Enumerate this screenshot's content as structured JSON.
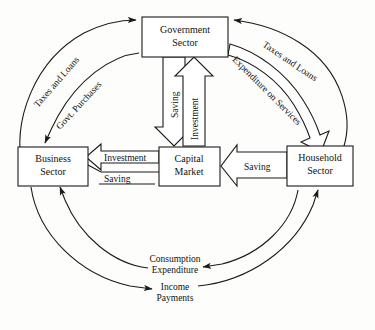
{
  "diagram": {
    "background_color": "#fdfdfc",
    "ink_color": "#1a1a1a",
    "nodes": [
      {
        "id": "government",
        "line1": "Government",
        "line2": "Sector",
        "x": 142,
        "y": 17,
        "w": 86,
        "h": 40
      },
      {
        "id": "business",
        "line1": "Business",
        "line2": "Sector",
        "x": 18,
        "y": 147,
        "w": 70,
        "h": 39
      },
      {
        "id": "capital",
        "line1": "Capital",
        "line2": "Market",
        "x": 159,
        "y": 147,
        "w": 61,
        "h": 39
      },
      {
        "id": "household",
        "line1": "Household",
        "line2": "Sector",
        "x": 287,
        "y": 146,
        "w": 66,
        "h": 40
      }
    ],
    "flows": [
      {
        "id": "taxes-loans-business",
        "label": "Taxes and Loans",
        "from": "business",
        "to": "government",
        "style": "thin-arc",
        "side": "left-outer"
      },
      {
        "id": "govt-purchases",
        "label": "Govt. Purchases",
        "from": "government",
        "to": "business",
        "style": "thin-arc",
        "side": "left-inner"
      },
      {
        "id": "taxes-loans-household",
        "label": "Taxes and Loans",
        "from": "household",
        "to": "government",
        "style": "thin-arc",
        "side": "right-outer"
      },
      {
        "id": "expenditure-on-services",
        "label": "Expenditure on Services",
        "from": "government",
        "to": "household",
        "style": "block-arrow",
        "side": "right-inner"
      },
      {
        "id": "saving-govt-capital",
        "label": "Saving",
        "from": "government",
        "to": "capital",
        "style": "block-arrow",
        "side": "center-down"
      },
      {
        "id": "investment-capital-govt",
        "label": "Investment",
        "from": "capital",
        "to": "government",
        "style": "block-arrow",
        "side": "center-up"
      },
      {
        "id": "investment-capital-business",
        "label": "Investment",
        "from": "capital",
        "to": "business",
        "style": "block-arrow",
        "side": "mid-left"
      },
      {
        "id": "saving-business-capital",
        "label": "Saving",
        "from": "business",
        "to": "capital",
        "style": "plain-line",
        "side": "mid-left-lower"
      },
      {
        "id": "saving-household-capital",
        "label": "Saving",
        "from": "household",
        "to": "capital",
        "style": "block-arrow",
        "side": "mid-right"
      },
      {
        "id": "consumption-expenditure",
        "label": "Consumption Expenditure",
        "from": "household",
        "to": "business",
        "style": "thin-arc",
        "side": "bottom-inner"
      },
      {
        "id": "income-payments",
        "label": "Income Payments",
        "from": "business",
        "to": "household",
        "style": "thin-arc",
        "side": "bottom-outer"
      }
    ],
    "labels": {
      "taxes_and_loans_left": "Taxes and Loans",
      "govt_purchases": "Govt. Purchases",
      "taxes_and_loans_right": "Taxes and Loans",
      "expenditure_on_services": "Expenditure on Services",
      "saving_vertical": "Saving",
      "investment_vertical": "Investment",
      "investment_mid": "Investment",
      "saving_business": "Saving",
      "saving_household": "Saving",
      "consumption_line1": "Consumption",
      "consumption_line2": "Expenditure",
      "income_line1": "Income",
      "income_line2": "Payments"
    }
  }
}
